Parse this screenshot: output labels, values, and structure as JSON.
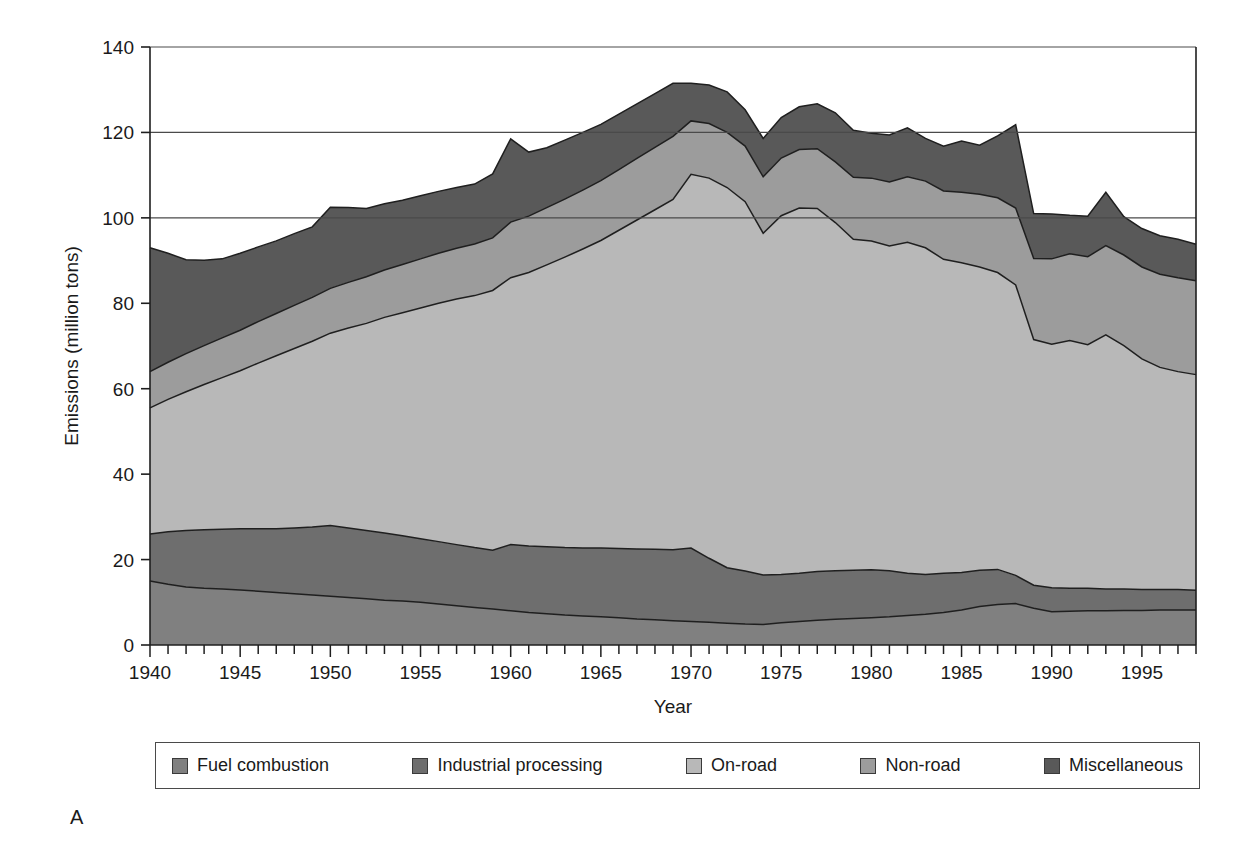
{
  "panel_label": "A",
  "legend": {
    "items": [
      {
        "label": "Fuel combustion",
        "color": "#808080"
      },
      {
        "label": "Industrial processing",
        "color": "#6e6e6e"
      },
      {
        "label": "On-road",
        "color": "#b8b8b8"
      },
      {
        "label": "Non-road",
        "color": "#9c9c9c"
      },
      {
        "label": "Miscellaneous",
        "color": "#595959"
      }
    ]
  },
  "chart_data": {
    "type": "area",
    "stacked": true,
    "title": "",
    "xlabel": "Year",
    "ylabel": "Emissions (million tons)",
    "xlim": [
      1940,
      1998
    ],
    "ylim": [
      0,
      140
    ],
    "yticks": [
      0,
      20,
      40,
      60,
      80,
      100,
      120,
      140
    ],
    "xticks_labeled": [
      1940,
      1945,
      1950,
      1955,
      1960,
      1965,
      1970,
      1975,
      1980,
      1985,
      1990,
      1995
    ],
    "xtick_interval": 1,
    "grid": "horizontal-major-above-100",
    "legend_position": "below",
    "x": [
      1940,
      1941,
      1942,
      1943,
      1944,
      1945,
      1946,
      1947,
      1948,
      1949,
      1950,
      1951,
      1952,
      1953,
      1954,
      1955,
      1956,
      1957,
      1958,
      1959,
      1960,
      1961,
      1962,
      1963,
      1964,
      1965,
      1966,
      1967,
      1968,
      1969,
      1970,
      1971,
      1972,
      1973,
      1974,
      1975,
      1976,
      1977,
      1978,
      1979,
      1980,
      1981,
      1982,
      1983,
      1984,
      1985,
      1986,
      1987,
      1988,
      1989,
      1990,
      1991,
      1992,
      1993,
      1994,
      1995,
      1996,
      1997,
      1998
    ],
    "series": [
      {
        "name": "Fuel combustion",
        "color": "#808080",
        "values": [
          15.0,
          14.2,
          13.6,
          13.3,
          13.1,
          12.9,
          12.6,
          12.3,
          12.0,
          11.7,
          11.4,
          11.1,
          10.8,
          10.5,
          10.3,
          10.0,
          9.6,
          9.2,
          8.8,
          8.4,
          8.0,
          7.6,
          7.3,
          7.0,
          6.8,
          6.6,
          6.4,
          6.1,
          5.9,
          5.7,
          5.5,
          5.3,
          5.1,
          4.9,
          4.8,
          5.2,
          5.5,
          5.8,
          6.0,
          6.2,
          6.4,
          6.6,
          6.9,
          7.2,
          7.6,
          8.2,
          9.0,
          9.5,
          9.7,
          8.6,
          7.8,
          7.9,
          8.0,
          8.0,
          8.1,
          8.1,
          8.2,
          8.2,
          8.2
        ]
      },
      {
        "name": "Industrial processing",
        "color": "#6e6e6e",
        "values": [
          11.0,
          12.3,
          13.2,
          13.7,
          14.0,
          14.3,
          14.6,
          14.9,
          15.4,
          15.9,
          16.6,
          16.3,
          16.0,
          15.7,
          15.3,
          14.9,
          14.6,
          14.3,
          14.0,
          13.8,
          15.5,
          15.6,
          15.7,
          15.8,
          15.9,
          16.1,
          16.2,
          16.4,
          16.5,
          16.6,
          17.2,
          15.0,
          13.0,
          12.4,
          11.6,
          11.3,
          11.3,
          11.4,
          11.4,
          11.3,
          11.2,
          10.8,
          9.9,
          9.3,
          9.2,
          8.8,
          8.5,
          8.2,
          6.6,
          5.4,
          5.6,
          5.4,
          5.3,
          5.1,
          5.0,
          4.9,
          4.8,
          4.8,
          4.6
        ]
      },
      {
        "name": "On-road",
        "color": "#b8b8b8",
        "values": [
          29.5,
          31.0,
          32.5,
          34.0,
          35.5,
          37.0,
          38.8,
          40.5,
          42.0,
          43.5,
          45.0,
          46.8,
          48.5,
          50.5,
          52.2,
          54.0,
          55.8,
          57.5,
          59.0,
          60.8,
          62.5,
          64.0,
          66.0,
          68.0,
          70.0,
          72.0,
          74.5,
          77.0,
          79.5,
          82.0,
          87.5,
          89.0,
          89.0,
          86.5,
          80.0,
          84.0,
          85.5,
          85.0,
          81.5,
          77.5,
          77.0,
          76.0,
          77.5,
          76.5,
          73.5,
          72.5,
          71.0,
          69.5,
          68.0,
          57.5,
          57.0,
          58.0,
          57.0,
          59.5,
          57.0,
          54.0,
          52.0,
          51.0,
          50.5
        ]
      },
      {
        "name": "Non-road",
        "color": "#9c9c9c",
        "values": [
          8.5,
          8.7,
          8.9,
          9.1,
          9.3,
          9.5,
          9.7,
          9.9,
          10.1,
          10.3,
          10.5,
          10.7,
          10.9,
          11.1,
          11.3,
          11.5,
          11.7,
          11.9,
          12.1,
          12.3,
          13.0,
          13.2,
          13.4,
          13.6,
          13.8,
          14.0,
          14.2,
          14.4,
          14.6,
          14.8,
          12.5,
          12.8,
          12.9,
          13.0,
          13.2,
          13.5,
          13.7,
          14.0,
          14.2,
          14.5,
          14.7,
          15.0,
          15.3,
          15.6,
          16.0,
          16.5,
          17.0,
          17.5,
          18.0,
          19.0,
          20.0,
          20.3,
          20.6,
          20.9,
          21.2,
          21.5,
          21.8,
          22.0,
          22.0
        ]
      },
      {
        "name": "Miscellaneous",
        "color": "#595959",
        "values": [
          29.0,
          25.5,
          22.0,
          20.0,
          18.5,
          18.0,
          17.5,
          17.0,
          16.8,
          16.5,
          19.0,
          17.5,
          16.0,
          15.5,
          15.0,
          14.8,
          14.5,
          14.2,
          14.0,
          15.0,
          19.5,
          15.0,
          14.0,
          13.8,
          13.5,
          13.2,
          13.0,
          12.8,
          12.6,
          12.4,
          8.8,
          9.0,
          9.5,
          8.5,
          9.0,
          9.5,
          10.0,
          10.5,
          11.5,
          11.0,
          10.5,
          11.0,
          11.5,
          10.0,
          10.5,
          12.0,
          11.5,
          14.5,
          19.5,
          10.5,
          10.5,
          9.0,
          9.5,
          12.5,
          9.0,
          9.0,
          9.0,
          9.0,
          8.5
        ]
      }
    ]
  }
}
